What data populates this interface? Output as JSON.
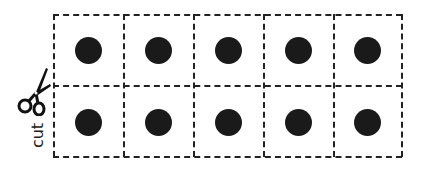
{
  "worksheet": {
    "rows": 2,
    "columns": 5,
    "cells": [
      {
        "row": 0,
        "col": 0,
        "content": "dot"
      },
      {
        "row": 0,
        "col": 1,
        "content": "dot"
      },
      {
        "row": 0,
        "col": 2,
        "content": "dot"
      },
      {
        "row": 0,
        "col": 3,
        "content": "dot"
      },
      {
        "row": 0,
        "col": 4,
        "content": "dot"
      },
      {
        "row": 1,
        "col": 0,
        "content": "dot"
      },
      {
        "row": 1,
        "col": 1,
        "content": "dot"
      },
      {
        "row": 1,
        "col": 2,
        "content": "dot"
      },
      {
        "row": 1,
        "col": 3,
        "content": "dot"
      },
      {
        "row": 1,
        "col": 4,
        "content": "dot"
      }
    ],
    "cut_label": "cut",
    "icon": "scissors-icon",
    "colors": {
      "line": "#222222",
      "dot": "#1a1a1a",
      "background": "#ffffff"
    }
  }
}
